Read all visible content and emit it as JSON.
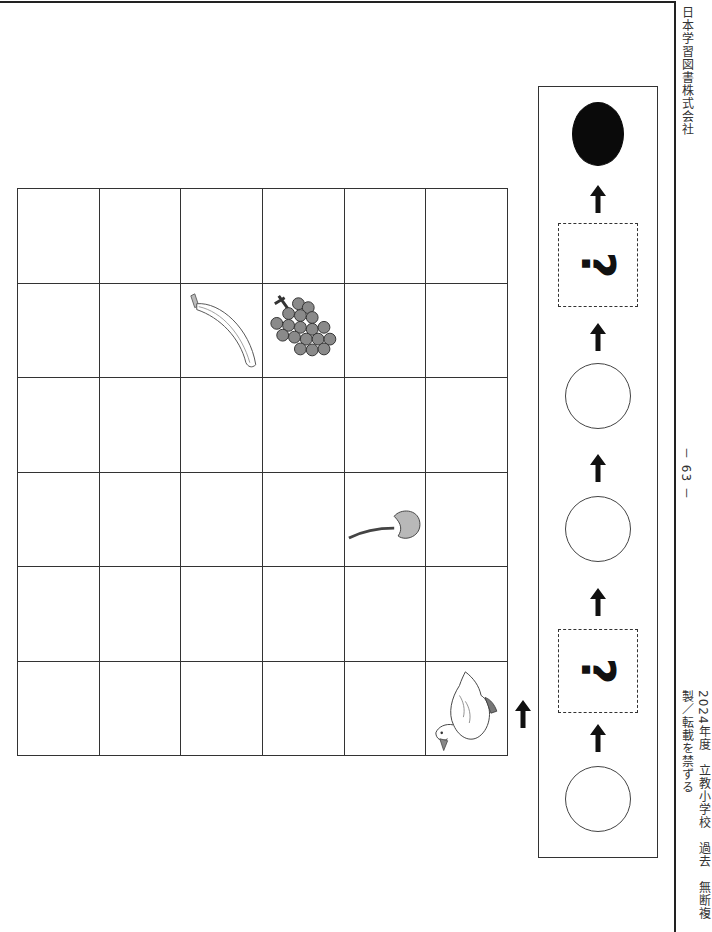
{
  "page": {
    "publisher": "日本学習図書株式会社",
    "page_number": "－ 63 －",
    "copyright": "2024年度　立教小学校　過去　無断複製／転載を禁ずる"
  },
  "grid": {
    "rows": 6,
    "cols": 6,
    "items": [
      {
        "name": "banana",
        "row": 1,
        "col": 2
      },
      {
        "name": "grapes",
        "row": 1,
        "col": 3
      },
      {
        "name": "cherry",
        "row": 3,
        "col": 4
      },
      {
        "name": "duck",
        "row": 5,
        "col": 5
      }
    ],
    "start_arrow": "up-arrow"
  },
  "sequence": {
    "order_bottom_to_top": [
      "empty-circle",
      "question-box",
      "empty-circle",
      "empty-circle",
      "question-box",
      "filled-circle"
    ],
    "question_mark": "?",
    "connector": "up-arrow"
  },
  "colors": {
    "line": "#333333",
    "filled_circle": "#0a0a0a",
    "fruit_gray": "#8a8a8a"
  }
}
